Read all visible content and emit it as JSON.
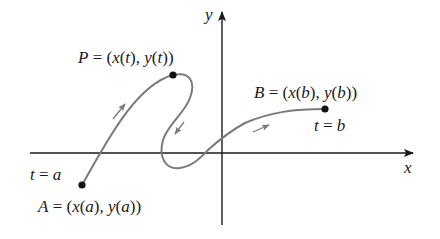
{
  "diagram": {
    "axes": {
      "x_label": "x",
      "y_label": "y"
    },
    "points": {
      "P": {
        "name": "P",
        "label": "P = (x(t), y(t))"
      },
      "A": {
        "name": "A",
        "label": "A = (x(a), y(a))",
        "parameter_label": "t = a"
      },
      "B": {
        "name": "B",
        "label": "B = (x(b), y(b))",
        "parameter_label": "t = b"
      }
    },
    "direction_arrows": [
      "up-right",
      "down-left",
      "right"
    ],
    "colors": {
      "axes": "#1a1a1a",
      "curve": "#7a7a7a",
      "points": "#111111",
      "background": "#ffffff"
    }
  }
}
